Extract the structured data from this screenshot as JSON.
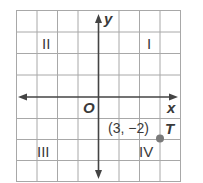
{
  "axes": {
    "x_label": "x",
    "y_label": "y",
    "origin_label": "O"
  },
  "quadrants": {
    "q1": "I",
    "q2": "II",
    "q3": "III",
    "q4": "IV"
  },
  "point": {
    "name": "T",
    "coords": "(3, −2)",
    "x": 3,
    "y": -2
  },
  "colors": {
    "grid": "#9a9a9a",
    "axis": "#444444",
    "point": "#777777"
  }
}
